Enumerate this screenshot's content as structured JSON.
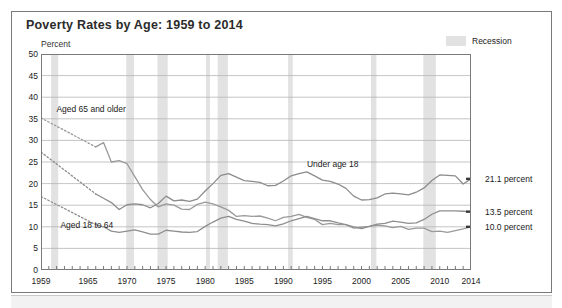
{
  "panel": {
    "title": "Poverty Rates by Age: 1959 to 2014"
  },
  "axis": {
    "ylabel": "Percent",
    "yticks": [
      50,
      45,
      40,
      35,
      30,
      25,
      20,
      15,
      10,
      5,
      0
    ],
    "xticks": [
      1959,
      1965,
      1970,
      1975,
      1980,
      1985,
      1990,
      1995,
      2000,
      2005,
      2010,
      2014
    ]
  },
  "legend": {
    "recession_label": "Recession",
    "recession_color": "#e2e2e2"
  },
  "annotations": {
    "aged65": "Aged 65 and older",
    "under18": "Under age 18",
    "aged1864": "Aged 18 to 64"
  },
  "end_labels": {
    "under18": "21.1 percent",
    "aged1864": "13.5 percent",
    "aged65": "10.0 percent"
  },
  "chart_data": {
    "type": "line",
    "title": "Poverty Rates by Age: 1959 to 2014",
    "xlabel": "",
    "ylabel": "Percent",
    "xlim": [
      1959,
      2014
    ],
    "ylim": [
      0,
      50
    ],
    "grid": true,
    "legend_position": "top-right",
    "colors": {
      "under18": "#8c8c8c",
      "aged1864": "#8e8e8e",
      "aged65": "#9a9a9a",
      "grid": "#b5b5b5",
      "frame": "#7a7a7a",
      "recession_band": "#e2e2e2"
    },
    "recessions": [
      {
        "start": 1960.3,
        "end": 1961.2
      },
      {
        "start": 1969.9,
        "end": 1970.9
      },
      {
        "start": 1973.9,
        "end": 1975.2
      },
      {
        "start": 1980.1,
        "end": 1980.6
      },
      {
        "start": 1981.6,
        "end": 1982.9
      },
      {
        "start": 1990.6,
        "end": 1991.2
      },
      {
        "start": 2001.2,
        "end": 2001.9
      },
      {
        "start": 2007.9,
        "end": 2009.5
      }
    ],
    "series": [
      {
        "name": "Under age 18",
        "end_value": 21.1,
        "dashed_before": 1966,
        "x": [
          1959,
          1960,
          1961,
          1962,
          1963,
          1964,
          1965,
          1966,
          1967,
          1968,
          1969,
          1970,
          1971,
          1972,
          1973,
          1974,
          1975,
          1976,
          1977,
          1978,
          1979,
          1980,
          1981,
          1982,
          1983,
          1984,
          1985,
          1986,
          1987,
          1988,
          1989,
          1990,
          1991,
          1992,
          1993,
          1994,
          1995,
          1996,
          1997,
          1998,
          1999,
          2000,
          2001,
          2002,
          2003,
          2004,
          2005,
          2006,
          2007,
          2008,
          2009,
          2010,
          2011,
          2012,
          2013,
          2014
        ],
        "values": [
          27.3,
          26.5,
          25.2,
          24.7,
          23.1,
          22.7,
          21.0,
          17.6,
          16.6,
          15.6,
          14.0,
          15.1,
          15.3,
          15.1,
          14.4,
          15.4,
          17.1,
          16.0,
          16.2,
          15.9,
          16.4,
          18.3,
          20.0,
          21.9,
          22.3,
          21.5,
          20.7,
          20.5,
          20.3,
          19.5,
          19.6,
          20.6,
          21.8,
          22.3,
          22.7,
          21.8,
          20.8,
          20.5,
          19.9,
          18.9,
          17.1,
          16.2,
          16.3,
          16.7,
          17.6,
          17.8,
          17.6,
          17.4,
          18.0,
          19.0,
          20.7,
          22.0,
          21.9,
          21.8,
          19.9,
          21.1
        ]
      },
      {
        "name": "Aged 18 to 64",
        "end_value": 13.5,
        "dashed_before": 1966,
        "x": [
          1959,
          1960,
          1961,
          1962,
          1963,
          1964,
          1965,
          1966,
          1967,
          1968,
          1969,
          1970,
          1971,
          1972,
          1973,
          1974,
          1975,
          1976,
          1977,
          1978,
          1979,
          1980,
          1981,
          1982,
          1983,
          1984,
          1985,
          1986,
          1987,
          1988,
          1989,
          1990,
          1991,
          1992,
          1993,
          1994,
          1995,
          1996,
          1997,
          1998,
          1999,
          2000,
          2001,
          2002,
          2003,
          2004,
          2005,
          2006,
          2007,
          2008,
          2009,
          2010,
          2011,
          2012,
          2013,
          2014
        ],
        "values": [
          17.0,
          16.4,
          16.1,
          15.5,
          14.7,
          14.2,
          13.5,
          10.5,
          10.0,
          9.0,
          8.7,
          9.0,
          9.3,
          8.8,
          8.3,
          8.3,
          9.2,
          9.0,
          8.8,
          8.7,
          8.9,
          10.1,
          11.1,
          12.0,
          12.4,
          11.7,
          11.3,
          10.8,
          10.6,
          10.5,
          10.2,
          10.7,
          11.4,
          11.9,
          12.4,
          11.9,
          11.4,
          11.4,
          10.9,
          10.5,
          10.0,
          9.6,
          10.1,
          10.6,
          10.8,
          11.3,
          11.1,
          10.8,
          10.9,
          11.7,
          12.9,
          13.7,
          13.7,
          13.7,
          13.6,
          13.5
        ]
      },
      {
        "name": "Aged 65 and older",
        "end_value": 10.0,
        "dashed_before": 1966,
        "x": [
          1959,
          1960,
          1961,
          1962,
          1963,
          1964,
          1965,
          1966,
          1967,
          1968,
          1969,
          1970,
          1971,
          1972,
          1973,
          1974,
          1975,
          1976,
          1977,
          1978,
          1979,
          1980,
          1981,
          1982,
          1983,
          1984,
          1985,
          1986,
          1987,
          1988,
          1989,
          1990,
          1991,
          1992,
          1993,
          1994,
          1995,
          1996,
          1997,
          1998,
          1999,
          2000,
          2001,
          2002,
          2003,
          2004,
          2005,
          2006,
          2007,
          2008,
          2009,
          2010,
          2011,
          2012,
          2013,
          2014
        ],
        "values": [
          35.2,
          35.0,
          34.2,
          33.1,
          32.5,
          31.0,
          30.0,
          28.5,
          29.5,
          25.0,
          25.3,
          24.6,
          21.6,
          18.6,
          16.3,
          14.6,
          15.3,
          15.0,
          14.1,
          14.0,
          15.2,
          15.7,
          15.3,
          14.6,
          13.8,
          12.4,
          12.6,
          12.4,
          12.5,
          12.0,
          11.4,
          12.2,
          12.4,
          12.9,
          12.2,
          11.7,
          10.5,
          10.8,
          10.5,
          10.5,
          9.7,
          9.9,
          10.1,
          10.4,
          10.2,
          9.8,
          10.1,
          9.4,
          9.7,
          9.7,
          8.9,
          9.0,
          8.7,
          9.1,
          9.5,
          10.0
        ]
      }
    ]
  }
}
